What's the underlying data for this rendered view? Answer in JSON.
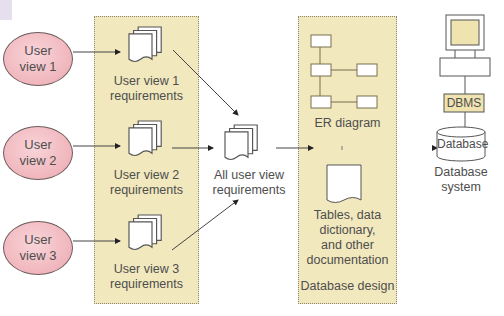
{
  "diagram": {
    "user_views": [
      {
        "label": "User\nview 1"
      },
      {
        "label": "User\nview 2"
      },
      {
        "label": "User\nview 3"
      }
    ],
    "requirements": [
      {
        "label": "User view 1\nrequirements"
      },
      {
        "label": "User view 2\nrequirements"
      },
      {
        "label": "User view 3\nrequirements"
      }
    ],
    "merged_requirements": {
      "label": "All user view\nrequirements"
    },
    "design_panel": {
      "er_label": "ER diagram",
      "docs_label": "Tables, data\ndictionary,\nand other\ndocumentation",
      "title": "Database design"
    },
    "system": {
      "dbms_label": "DBMS",
      "database_label": "Database",
      "caption": "Database\nsystem"
    },
    "colors": {
      "panel": "#f1e8bd",
      "ellipse": "#f0b5bc",
      "dbms_box": "#efe3b0",
      "line": "#4a4a4a"
    }
  }
}
